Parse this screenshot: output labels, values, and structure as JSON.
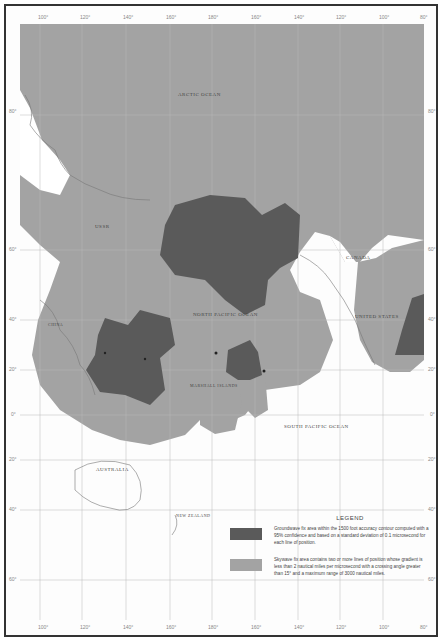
{
  "map": {
    "title": "",
    "longitude_ticks_top": [
      "100°",
      "120°",
      "140°",
      "160°",
      "180°",
      "160°",
      "140°",
      "120°",
      "100°",
      "80°"
    ],
    "longitude_ticks_bottom": [
      "100°",
      "120°",
      "140°",
      "160°",
      "180°",
      "160°",
      "140°",
      "120°",
      "100°",
      "80°"
    ],
    "latitude_ticks_left": [
      "80°",
      "60°",
      "40°",
      "20°",
      "0°",
      "20°",
      "40°",
      "60°"
    ],
    "latitude_ticks_right": [
      "80°",
      "60°",
      "40°",
      "20°",
      "0°",
      "20°",
      "40°",
      "60°"
    ],
    "labels": {
      "arctic_ocean": "ARCTIC OCEAN",
      "ussr": "USSR",
      "canada": "CANADA",
      "north_pacific": "NORTH PACIFIC OCEAN",
      "united_states": "UNITED STATES",
      "south_pacific": "SOUTH PACIFIC OCEAN",
      "australia": "AUSTRALIA",
      "new_zealand": "NEW ZEALAND",
      "china": "CHINA",
      "marshall": "MARSHALL ISLANDS"
    },
    "colors": {
      "skywave": "#a3a3a3",
      "groundwave": "#5a5a5a",
      "ocean": "#ffffff",
      "grid": "#bbbbbb",
      "coast": "#777777"
    }
  },
  "legend": {
    "title": "LEGEND",
    "items": [
      {
        "swatch": "groundwave",
        "text": "Groundwave fix area within the 1500 foot accuracy contour computed with a 95% confidence and based on a standard deviation of 0.1 microsecond for each line of position."
      },
      {
        "swatch": "skywave",
        "text": "Skywave fix area contains two or more lines of position whose gradient is less than 2 nautical miles per microsecond with a crossing angle greater than 15° and a maximum range of 3000 nautical miles."
      }
    ]
  }
}
